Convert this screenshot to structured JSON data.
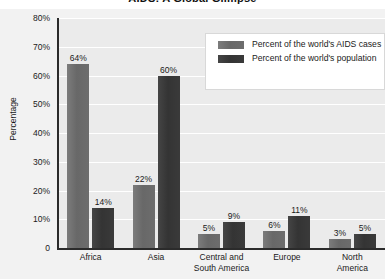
{
  "chart_data": {
    "type": "bar",
    "title": "AIDS: A Global Glimpse",
    "xlabel": "",
    "ylabel": "Percentage",
    "ylim": [
      0,
      80
    ],
    "yticks": [
      "0",
      "10%",
      "20%",
      "30%",
      "40%",
      "50%",
      "60%",
      "70%",
      "80%"
    ],
    "grid": true,
    "legend_position": "top-right",
    "categories": [
      "Africa",
      "Asia",
      "Central and South America",
      "Europe",
      "North America"
    ],
    "series": [
      {
        "name": "Percent of the world's AIDS cases",
        "color": "#6d6d6d",
        "values": [
          64,
          22,
          5,
          6,
          3
        ],
        "labels": [
          "64%",
          "22%",
          "5%",
          "6%",
          "3%"
        ]
      },
      {
        "name": "Percent of the world's population",
        "color": "#3a3a3a",
        "values": [
          14,
          60,
          9,
          11,
          5
        ],
        "labels": [
          "14%",
          "60%",
          "9%",
          "11%",
          "5%"
        ]
      }
    ]
  },
  "category_lines": [
    [
      "Africa"
    ],
    [
      "Asia"
    ],
    [
      "Central and",
      "South America"
    ],
    [
      "Europe"
    ],
    [
      "North",
      "America"
    ]
  ]
}
